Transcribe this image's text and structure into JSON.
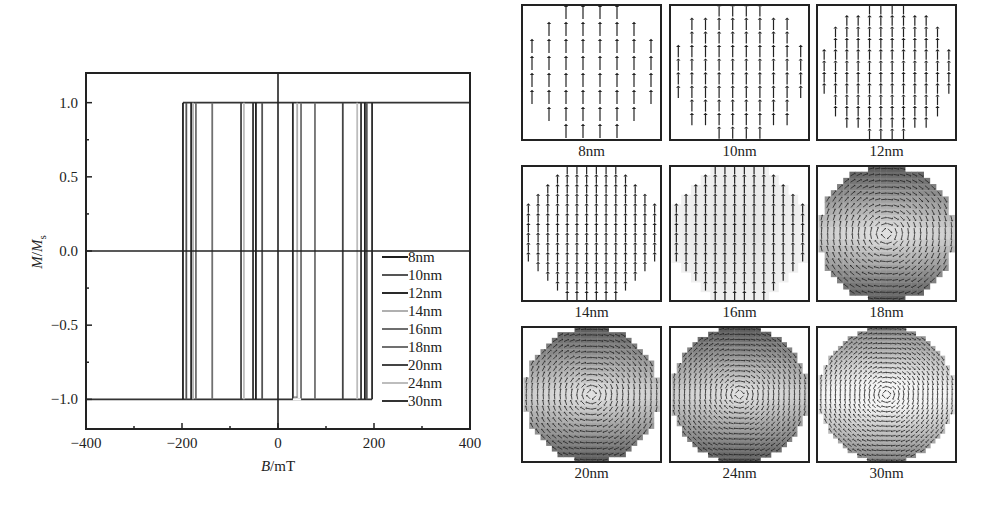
{
  "chart_data": [
    {
      "type": "line",
      "title": "",
      "xlabel": "B/mT",
      "ylabel": "M/Ms",
      "xlim": [
        -400,
        400
      ],
      "ylim": [
        -1.2,
        1.2
      ],
      "xticks": [
        -400,
        -200,
        0,
        200,
        400
      ],
      "xtick_labels": [
        "−400",
        "−200",
        "0",
        "200",
        "400"
      ],
      "yticks": [
        1.0,
        0.5,
        0.0,
        -0.5,
        -1.0
      ],
      "ytick_labels": [
        "1.0",
        "0.5",
        "0.0",
        "−0.5",
        "−1.0"
      ],
      "grid": false,
      "legend_position": "lower right",
      "description": "Square hysteresis loops of M/Ms vs B for nanodisks of different diameters; magnetization switches between +1 and -1 at coercive fields",
      "series": [
        {
          "name": "8nm",
          "color": "#1e1e1e",
          "coercive_field_mT": 31
        },
        {
          "name": "10nm",
          "color": "#555555",
          "coercive_field_mT": 46
        },
        {
          "name": "12nm",
          "color": "#2a2a2a",
          "coercive_field_mT": 77
        },
        {
          "name": "14nm",
          "color": "#b0b0b0",
          "coercive_field_mT": 52
        },
        {
          "name": "16nm",
          "color": "#6e6e6e",
          "coercive_field_mT": 135
        },
        {
          "name": "18nm",
          "color": "#707070",
          "coercive_field_mT": 177
        },
        {
          "name": "20nm",
          "color": "#444444",
          "coercive_field_mT": 181
        },
        {
          "name": "24nm",
          "color": "#bdbdbd",
          "coercive_field_mT": 191
        },
        {
          "name": "30nm",
          "color": "#333333",
          "coercive_field_mT": 171
        }
      ],
      "switching_lines_mT": [
        -198,
        -191,
        -181,
        -177,
        -171,
        -137,
        -77,
        -71,
        -52,
        -46,
        -33,
        31,
        40,
        48,
        77,
        135,
        165,
        173,
        181,
        185,
        196
      ]
    },
    {
      "type": "heatmap",
      "title": "Magnetization configurations (vector maps) for disk diameters",
      "panels": [
        "8nm",
        "10nm",
        "12nm",
        "14nm",
        "16nm",
        "18nm",
        "20nm",
        "24nm",
        "30nm"
      ],
      "description": "3x3 grid of micromagnetic spin maps; small disks (8-16nm) uniformly magnetized upward, larger disks (18-30nm) show vortex-like state with grayscale shading"
    }
  ],
  "plot": {
    "xlabel_italic": "B",
    "xlabel_unit": "/mT",
    "ylabel_m": "M",
    "ylabel_sep": "/",
    "ylabel_ms": "M",
    "ylabel_sub": "s"
  },
  "legend": [
    "8nm",
    "10nm",
    "12nm",
    "14nm",
    "16nm",
    "18nm",
    "20nm",
    "24nm",
    "30nm"
  ],
  "panels": [
    {
      "label": "8nm",
      "kind": "uniform",
      "grid": 8
    },
    {
      "label": "10nm",
      "kind": "uniform",
      "grid": 10
    },
    {
      "label": "12nm",
      "kind": "uniform",
      "grid": 12
    },
    {
      "label": "14nm",
      "kind": "uniform",
      "grid": 14
    },
    {
      "label": "16nm",
      "kind": "uniform-shaded",
      "grid": 14
    },
    {
      "label": "18nm",
      "kind": "vortex",
      "grid": 22
    },
    {
      "label": "20nm",
      "kind": "vortex",
      "grid": 24
    },
    {
      "label": "24nm",
      "kind": "vortex",
      "grid": 26
    },
    {
      "label": "30nm",
      "kind": "vortex-light",
      "grid": 28
    }
  ]
}
